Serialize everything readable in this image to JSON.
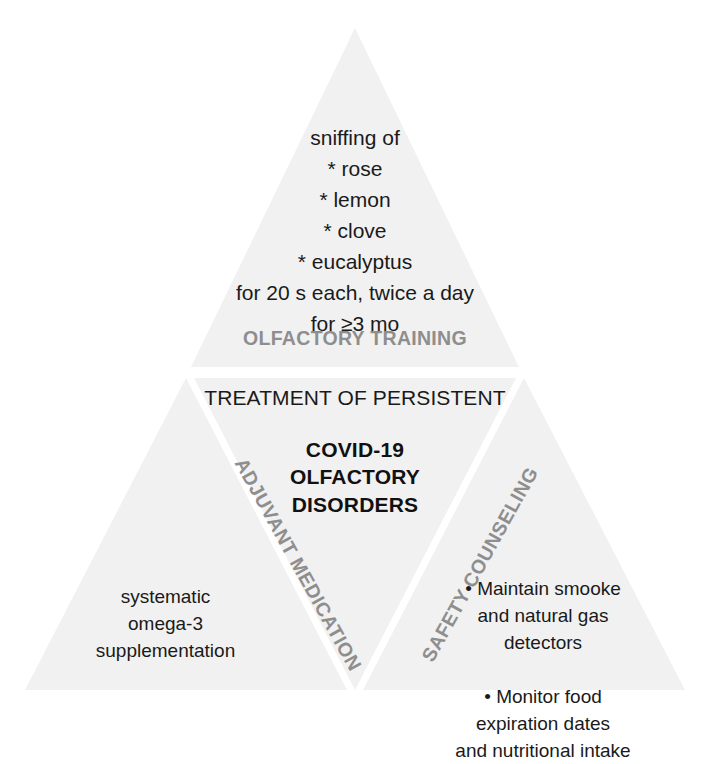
{
  "diagram": {
    "type": "triangle-partition",
    "fill_color": "#f1f1f1",
    "label_gray": "#8e8e8e",
    "text_black": "#1a1a1a",
    "background": "#ffffff",
    "center": {
      "kicker": "TREATMENT OF PERSISTENT",
      "title": "COVID-19\nOLFACTORY\nDISORDERS"
    },
    "sections": {
      "top": {
        "label": "OLFACTORY TRAINING",
        "body": "sniffing of\n* rose\n* lemon\n* clove\n* eucalyptus\nfor 20 s each, twice a day\nfor ≥3 mo"
      },
      "bottom_left": {
        "label": "ADJUVANT MEDICATION",
        "body": "systematic\nomega-3\nsupplementation"
      },
      "bottom_right": {
        "label": "SAFETY COUNSELING",
        "body": "• Maintain smooke\nand natural gas\ndetectors\n\n• Monitor food\nexpiration dates\nand nutritional intake"
      }
    },
    "caption": ""
  }
}
